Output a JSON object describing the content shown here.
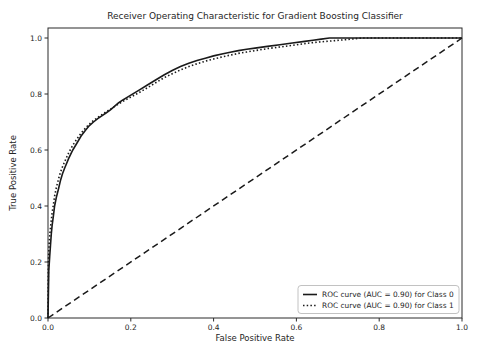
{
  "chart_data": {
    "type": "line",
    "title": "Receiver Operating Characteristic for Gradient Boosting Classifier",
    "xlabel": "False Positive Rate",
    "ylabel": "True Positive Rate",
    "xlim": [
      0.0,
      1.0
    ],
    "ylim": [
      0.0,
      1.05
    ],
    "x_ticks": [
      "0.0",
      "0.2",
      "0.4",
      "0.6",
      "0.8",
      "1.0"
    ],
    "y_ticks": [
      "0.0",
      "0.2",
      "0.4",
      "0.6",
      "0.8",
      "1.0"
    ],
    "grid": false,
    "legend_position": "lower right",
    "line_color": "#1a1a1a",
    "frame_border_color": "#b3b3b3",
    "legend": [
      {
        "label": "ROC curve (AUC = 0.90) for Class 0",
        "style": "solid",
        "auc": 0.9
      },
      {
        "label": "ROC curve (AUC = 0.90) for Class 1",
        "style": "dotted",
        "auc": 0.9
      }
    ],
    "series": [
      {
        "name": "ROC curve (AUC = 0.90) for Class 0",
        "style": "solid",
        "points": [
          [
            0,
            0
          ],
          [
            0.002,
            0.17
          ],
          [
            0.004,
            0.22
          ],
          [
            0.006,
            0.26
          ],
          [
            0.008,
            0.3
          ],
          [
            0.01,
            0.33
          ],
          [
            0.013,
            0.365
          ],
          [
            0.016,
            0.4
          ],
          [
            0.02,
            0.43
          ],
          [
            0.025,
            0.46
          ],
          [
            0.03,
            0.49
          ],
          [
            0.035,
            0.515
          ],
          [
            0.04,
            0.535
          ],
          [
            0.05,
            0.57
          ],
          [
            0.06,
            0.6
          ],
          [
            0.07,
            0.625
          ],
          [
            0.08,
            0.65
          ],
          [
            0.09,
            0.67
          ],
          [
            0.1,
            0.687
          ],
          [
            0.11,
            0.7
          ],
          [
            0.12,
            0.712
          ],
          [
            0.13,
            0.722
          ],
          [
            0.14,
            0.732
          ],
          [
            0.15,
            0.742
          ],
          [
            0.16,
            0.755
          ],
          [
            0.17,
            0.768
          ],
          [
            0.18,
            0.778
          ],
          [
            0.19,
            0.787
          ],
          [
            0.2,
            0.796
          ],
          [
            0.22,
            0.814
          ],
          [
            0.24,
            0.832
          ],
          [
            0.26,
            0.85
          ],
          [
            0.28,
            0.868
          ],
          [
            0.3,
            0.884
          ],
          [
            0.32,
            0.898
          ],
          [
            0.34,
            0.91
          ],
          [
            0.36,
            0.92
          ],
          [
            0.38,
            0.928
          ],
          [
            0.4,
            0.936
          ],
          [
            0.42,
            0.943
          ],
          [
            0.44,
            0.949
          ],
          [
            0.46,
            0.955
          ],
          [
            0.48,
            0.96
          ],
          [
            0.5,
            0.964
          ],
          [
            0.53,
            0.97
          ],
          [
            0.56,
            0.976
          ],
          [
            0.59,
            0.982
          ],
          [
            0.62,
            0.988
          ],
          [
            0.64,
            0.992
          ],
          [
            0.66,
            0.996
          ],
          [
            0.68,
            1
          ],
          [
            1,
            1
          ]
        ]
      },
      {
        "name": "ROC curve (AUC = 0.90) for Class 1",
        "style": "dotted",
        "points": [
          [
            0,
            0
          ],
          [
            0.001,
            0.2
          ],
          [
            0.003,
            0.27
          ],
          [
            0.005,
            0.31
          ],
          [
            0.008,
            0.35
          ],
          [
            0.01,
            0.375
          ],
          [
            0.013,
            0.405
          ],
          [
            0.016,
            0.435
          ],
          [
            0.02,
            0.465
          ],
          [
            0.025,
            0.495
          ],
          [
            0.03,
            0.52
          ],
          [
            0.035,
            0.54
          ],
          [
            0.04,
            0.558
          ],
          [
            0.05,
            0.59
          ],
          [
            0.06,
            0.617
          ],
          [
            0.07,
            0.64
          ],
          [
            0.08,
            0.66
          ],
          [
            0.09,
            0.678
          ],
          [
            0.1,
            0.693
          ],
          [
            0.11,
            0.705
          ],
          [
            0.12,
            0.716
          ],
          [
            0.13,
            0.726
          ],
          [
            0.14,
            0.736
          ],
          [
            0.15,
            0.745
          ],
          [
            0.16,
            0.755
          ],
          [
            0.17,
            0.764
          ],
          [
            0.18,
            0.773
          ],
          [
            0.19,
            0.781
          ],
          [
            0.2,
            0.789
          ],
          [
            0.22,
            0.805
          ],
          [
            0.24,
            0.822
          ],
          [
            0.26,
            0.84
          ],
          [
            0.28,
            0.858
          ],
          [
            0.3,
            0.872
          ],
          [
            0.32,
            0.886
          ],
          [
            0.34,
            0.898
          ],
          [
            0.36,
            0.908
          ],
          [
            0.38,
            0.917
          ],
          [
            0.4,
            0.925
          ],
          [
            0.42,
            0.932
          ],
          [
            0.44,
            0.939
          ],
          [
            0.46,
            0.945
          ],
          [
            0.48,
            0.95
          ],
          [
            0.5,
            0.955
          ],
          [
            0.53,
            0.962
          ],
          [
            0.56,
            0.968
          ],
          [
            0.59,
            0.974
          ],
          [
            0.62,
            0.98
          ],
          [
            0.65,
            0.985
          ],
          [
            0.68,
            0.989
          ],
          [
            0.71,
            0.993
          ],
          [
            0.74,
            0.997
          ],
          [
            0.76,
            1
          ],
          [
            1,
            1
          ]
        ]
      }
    ],
    "diagonal": {
      "name": "chance line",
      "style": "dashed",
      "points": [
        [
          0,
          0
        ],
        [
          1,
          1
        ]
      ]
    }
  }
}
